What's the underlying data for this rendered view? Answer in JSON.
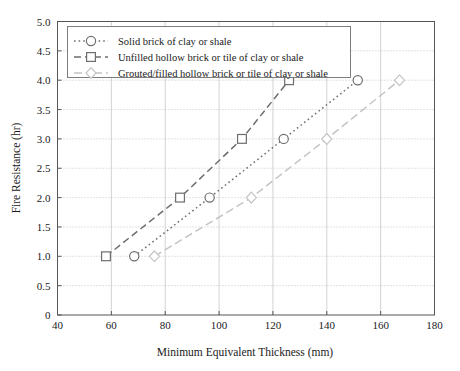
{
  "chart_data": {
    "type": "line",
    "title": "",
    "xlabel": "Minimum Equivalent Thickness (mm)",
    "ylabel": "Fire Resistance (hr)",
    "xlim": [
      40,
      180
    ],
    "ylim": [
      0,
      5.0
    ],
    "xticks": [
      40,
      60,
      80,
      100,
      120,
      140,
      160,
      180
    ],
    "xticklabels": [
      "40",
      "60",
      "80",
      "100",
      "120",
      "140",
      "160",
      "180"
    ],
    "yticks": [
      0,
      0.5,
      1.0,
      1.5,
      2.0,
      2.5,
      3.0,
      3.5,
      4.0,
      4.5,
      5.0
    ],
    "yticklabels": [
      "0",
      "0.5",
      "1.0",
      "1.5",
      "2.0",
      "2.5",
      "3.0",
      "3.5",
      "4.0",
      "4.5",
      "5.0"
    ],
    "grid": true,
    "legend_position": "upper left",
    "series": [
      {
        "name": "Solid brick of clay or shale",
        "marker": "circle",
        "linestyle": "dotted",
        "color": "#6e6e6e",
        "x": [
          68.5,
          96.5,
          124,
          151.5
        ],
        "y": [
          1.0,
          2.0,
          3.0,
          4.0
        ]
      },
      {
        "name": "Unfilled hollow brick or tile of clay or shale",
        "marker": "square",
        "linestyle": "dashed",
        "color": "#6e6e6e",
        "x": [
          58,
          85.5,
          108.5,
          126
        ],
        "y": [
          1.0,
          2.0,
          3.0,
          4.0
        ]
      },
      {
        "name": "Grouted/filled hollow brick or tile of clay or shale",
        "marker": "diamond",
        "linestyle": "dashdot",
        "color": "#c4c4c4",
        "x": [
          76,
          112,
          140,
          167
        ],
        "y": [
          1.0,
          2.0,
          3.0,
          4.0
        ]
      }
    ]
  },
  "legend": {
    "items": [
      "Solid brick of clay or shale",
      "Unfilled hollow brick or tile of clay or shale",
      "Grouted/filled hollow brick or tile of clay or shale"
    ]
  },
  "colors": {
    "series_dark": "#6e6e6e",
    "series_light": "#c4c4c4",
    "axis": "#555555",
    "grid_horizontal": "#b8b8b8",
    "grid_vertical": "#c8c8c8",
    "background": "#ffffff",
    "text": "#1a1a1a"
  }
}
